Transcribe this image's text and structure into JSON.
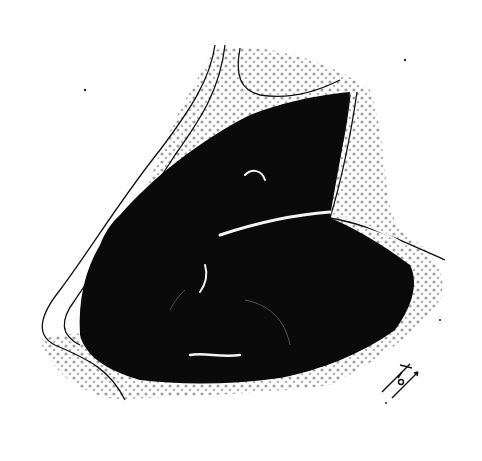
{
  "figure": {
    "type": "monochrome illustration",
    "colors": {
      "ink": "#0a0a0a",
      "stipple": "#8a8a8a",
      "paper": "#fefefe"
    },
    "signature": "monogram"
  }
}
